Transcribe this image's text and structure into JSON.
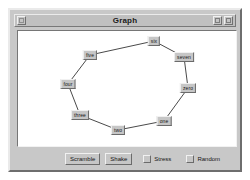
{
  "window": {
    "title": "Graph",
    "titlebar": {
      "menu_button": "window-menu",
      "minimize_button": "minimize",
      "maximize_button": "maximize"
    }
  },
  "graph": {
    "nodes": [
      {
        "label": "six",
        "x": 136,
        "y": 10
      },
      {
        "label": "seven",
        "x": 166,
        "y": 26
      },
      {
        "label": "zero",
        "x": 170,
        "y": 57
      },
      {
        "label": "one",
        "x": 146,
        "y": 90
      },
      {
        "label": "two",
        "x": 100,
        "y": 99
      },
      {
        "label": "three",
        "x": 62,
        "y": 84
      },
      {
        "label": "four",
        "x": 50,
        "y": 53
      },
      {
        "label": "five",
        "x": 72,
        "y": 24
      }
    ],
    "edges": [
      {
        "from": "six",
        "to": "seven"
      },
      {
        "from": "seven",
        "to": "zero"
      },
      {
        "from": "zero",
        "to": "one"
      },
      {
        "from": "one",
        "to": "two"
      },
      {
        "from": "two",
        "to": "three"
      },
      {
        "from": "three",
        "to": "four"
      },
      {
        "from": "four",
        "to": "five"
      },
      {
        "from": "five",
        "to": "six"
      }
    ],
    "edge_color": "#4a4a4a"
  },
  "controls": {
    "scramble_label": "Scramble",
    "shake_label": "Shake",
    "stress_label": "Stress",
    "stress_checked": false,
    "random_label": "Random",
    "random_checked": false
  }
}
